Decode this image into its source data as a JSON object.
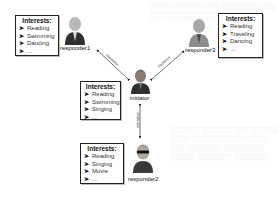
{
  "diagram": {
    "interests_title": "Interests:",
    "bullet": "➤",
    "edge_label": "interaction",
    "nodes": {
      "responder1": {
        "label": "responder1",
        "interests": [
          "Reading",
          "Swimming",
          "Dancing",
          "..."
        ]
      },
      "responder3": {
        "label": "responder3",
        "interests": [
          "Reading",
          "Traveling",
          "Dancing",
          "..."
        ]
      },
      "initiator": {
        "label": "initiator",
        "interests": [
          "Reading",
          "Swimming",
          "Singing",
          "..."
        ]
      },
      "responder2": {
        "label": "responder2",
        "interests": [
          "Reading",
          "Singing",
          "Movie",
          "..."
        ]
      }
    },
    "edges": [
      {
        "from": "initiator",
        "to": "responder1",
        "label": "interaction"
      },
      {
        "from": "initiator",
        "to": "responder3",
        "label": "interaction"
      },
      {
        "from": "initiator",
        "to": "responder2",
        "label": "interaction"
      }
    ]
  },
  "colors": {
    "border": "#222222",
    "text": "#111111",
    "person_dark": "#3a3a3a",
    "person_light": "#9a9a9a"
  }
}
